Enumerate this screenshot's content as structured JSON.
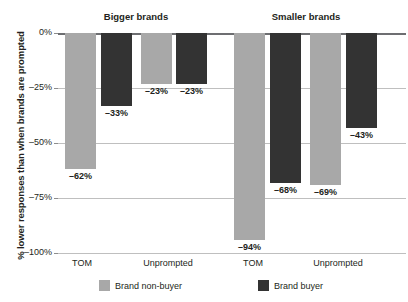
{
  "chart_data": {
    "type": "bar",
    "title": "",
    "subtitle": "",
    "xlabel": "",
    "ylabel": "% lower responses than when brands are prompted",
    "ylim": [
      -100,
      0
    ],
    "yticks": [
      0,
      -25,
      -50,
      -75,
      -100
    ],
    "ytick_labels": [
      "0%",
      "–25%",
      "–50%",
      "–75%",
      "–100%"
    ],
    "grid": true,
    "legend_position": "bottom",
    "group_titles": [
      "Bigger brands",
      "Smaller brands"
    ],
    "categories": [
      "TOM",
      "Unprompted",
      "TOM",
      "Unprompted"
    ],
    "series": [
      {
        "name": "Brand non-buyer",
        "color": "#a8a8a8",
        "values": [
          -62,
          -23,
          -94,
          -69
        ],
        "labels": [
          "–62%",
          "–23%",
          "–94%",
          "–69%"
        ]
      },
      {
        "name": "Brand buyer",
        "color": "#333333",
        "values": [
          -33,
          -23,
          -68,
          -43
        ],
        "labels": [
          "–33%",
          "–23%",
          "–68%",
          "–43%"
        ]
      }
    ],
    "groups": [
      {
        "title": "Bigger brands",
        "bars": [
          {
            "category": "TOM",
            "series": "Brand non-buyer",
            "value": -62,
            "label": "–62%"
          },
          {
            "category": "TOM",
            "series": "Brand buyer",
            "value": -33,
            "label": "–33%"
          },
          {
            "category": "Unprompted",
            "series": "Brand non-buyer",
            "value": -23,
            "label": "–23%"
          },
          {
            "category": "Unprompted",
            "series": "Brand buyer",
            "value": -23,
            "label": "–23%"
          }
        ]
      },
      {
        "title": "Smaller brands",
        "bars": [
          {
            "category": "TOM",
            "series": "Brand non-buyer",
            "value": -94,
            "label": "–94%"
          },
          {
            "category": "TOM",
            "series": "Brand buyer",
            "value": -68,
            "label": "–68%"
          },
          {
            "category": "Unprompted",
            "series": "Brand non-buyer",
            "value": -69,
            "label": "–69%"
          },
          {
            "category": "Unprompted",
            "series": "Brand buyer",
            "value": -43,
            "label": "–43%"
          }
        ]
      }
    ]
  },
  "axis": {
    "y_title": "% lower responses than when brands are prompted",
    "ticks": [
      {
        "label": "0%",
        "value": 0
      },
      {
        "label": "–25%",
        "value": -25
      },
      {
        "label": "–50%",
        "value": -50
      },
      {
        "label": "–75%",
        "value": -75
      },
      {
        "label": "–100%",
        "value": -100
      }
    ],
    "category_labels": [
      "TOM",
      "Unprompted",
      "TOM",
      "Unprompted"
    ]
  },
  "legend": {
    "items": [
      {
        "label": "Brand non-buyer",
        "color": "#a8a8a8"
      },
      {
        "label": "Brand buyer",
        "color": "#333333"
      }
    ]
  },
  "colors": {
    "light_bar": "#a8a8a8",
    "dark_bar": "#333333",
    "gridline": "#bfbfbf",
    "zero_line": "#6d6e71",
    "text": "#231f20",
    "background": "#ffffff"
  }
}
